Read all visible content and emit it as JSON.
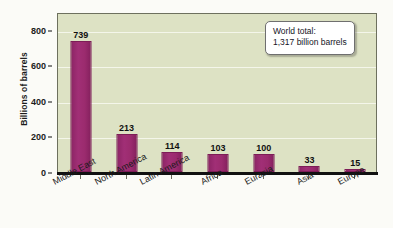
{
  "chart_data": {
    "type": "bar",
    "title": "",
    "xlabel": "",
    "ylabel": "Billions of barrels",
    "categories": [
      "Middle East",
      "North America",
      "Latin America",
      "Africa",
      "Eurasia",
      "Asia",
      "Europe"
    ],
    "values": [
      739,
      213,
      114,
      103,
      100,
      33,
      15
    ],
    "value_labels": [
      "739",
      "213",
      "114",
      "103",
      "100",
      "33",
      "15"
    ],
    "ylim": [
      0,
      900
    ],
    "yticks": [
      0,
      200,
      400,
      600,
      800
    ],
    "ytick_labels": [
      "0",
      "200",
      "400",
      "600",
      "800"
    ],
    "grid": "horizontal",
    "legend": "none",
    "annotations": [
      {
        "name": "world-total-note",
        "line1": "World total:",
        "line2": "1,317 billion barrels",
        "position": "top-right"
      }
    ],
    "colors": {
      "bar": "#9b2b6e",
      "plot_background": "#dde2c4",
      "gridline": "#f4f6ea",
      "axis": "#111111",
      "figure_background": "#fbfbf7"
    }
  }
}
